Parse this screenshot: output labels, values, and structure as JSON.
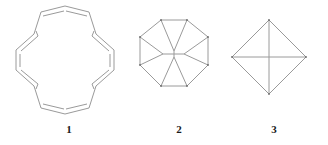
{
  "page": {
    "background_color": "#ffffff",
    "stroke_color": "#9a9a9a",
    "caption_color": "#1a1a1a",
    "width": 328,
    "height": 145
  },
  "figures": [
    {
      "id": "figure-1",
      "label": "1",
      "name": "macrocyclic-annulene-diagram",
      "description": "cyclic polyene macrocycle with alternating double bonds",
      "shape_type": "polygon-outline-with-double-bonds",
      "vertex_count": 18,
      "double_bond_count": 9
    },
    {
      "id": "figure-2",
      "label": "2",
      "name": "octagon-pinwheel-diagram",
      "description": "regular octagon with internal pinwheel spokes meeting a central hub",
      "shape_type": "octagon",
      "vertex_count": 8,
      "spoke_count": 8
    },
    {
      "id": "figure-3",
      "label": "3",
      "name": "diamond-diagonals-diagram",
      "description": "square rotated 45 degrees with both diagonals drawn",
      "shape_type": "rhombus",
      "vertex_count": 4,
      "diagonal_count": 2
    }
  ],
  "captions": {
    "first": "1",
    "second": "2",
    "third": "3"
  }
}
